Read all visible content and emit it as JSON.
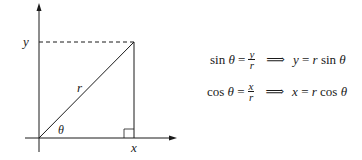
{
  "diagram": {
    "labels": {
      "y_axis_label": "y",
      "x_axis_label": "x",
      "hypotenuse_label": "r",
      "angle_label": "θ"
    },
    "colors": {
      "line": "#1a1a1a",
      "background": "#ffffff"
    }
  },
  "equations": [
    {
      "lhs_fn": "sin",
      "lhs_var": "θ",
      "equals": "=",
      "frac_num": "y",
      "frac_den": "r",
      "implies": "⟹",
      "rhs_target": "y",
      "rhs_equals": "=",
      "rhs_r": "r",
      "rhs_fn": "sin",
      "rhs_var": "θ"
    },
    {
      "lhs_fn": "cos",
      "lhs_var": "θ",
      "equals": "=",
      "frac_num": "x",
      "frac_den": "r",
      "implies": "⟹",
      "rhs_target": "x",
      "rhs_equals": "=",
      "rhs_r": "r",
      "rhs_fn": "cos",
      "rhs_var": "θ"
    }
  ]
}
